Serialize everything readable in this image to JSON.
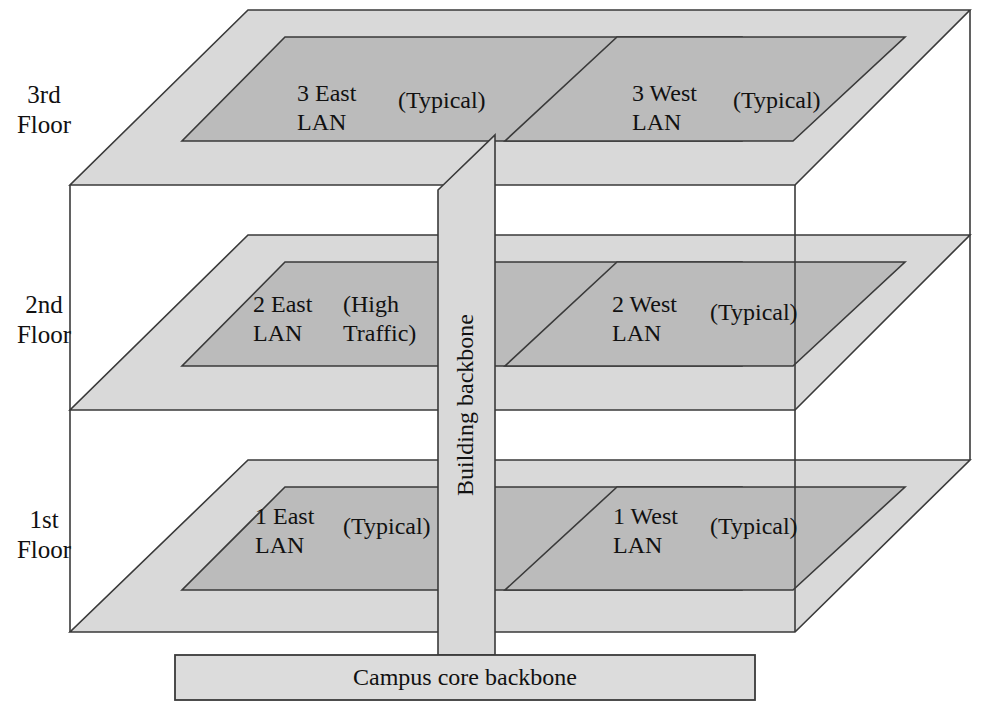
{
  "diagram": {
    "colors": {
      "slab_outer": "#d9d9d9",
      "slab_inner": "#bbbbbb",
      "stroke": "#3a3a3a",
      "core_bar": "#dcdcdc",
      "background": "#ffffff",
      "text": "#111111"
    }
  },
  "floors": [
    {
      "label_line1": "3rd",
      "label_line2": "Floor",
      "east": {
        "name_line1": "3 East",
        "name_line2": "LAN",
        "note_line1": "(Typical)",
        "note_line2": ""
      },
      "west": {
        "name_line1": "3 West",
        "name_line2": "LAN",
        "note_line1": "(Typical)",
        "note_line2": ""
      }
    },
    {
      "label_line1": "2nd",
      "label_line2": "Floor",
      "east": {
        "name_line1": "2 East",
        "name_line2": "LAN",
        "note_line1": "(High",
        "note_line2": "Traffic)"
      },
      "west": {
        "name_line1": "2 West",
        "name_line2": "LAN",
        "note_line1": "(Typical)",
        "note_line2": ""
      }
    },
    {
      "label_line1": "1st",
      "label_line2": "Floor",
      "east": {
        "name_line1": "1 East",
        "name_line2": "LAN",
        "note_line1": "(Typical)",
        "note_line2": ""
      },
      "west": {
        "name_line1": "1 West",
        "name_line2": "LAN",
        "note_line1": "(Typical)",
        "note_line2": ""
      }
    }
  ],
  "backbone": {
    "vertical_label": "Building backbone",
    "core_label": "Campus core backbone"
  }
}
